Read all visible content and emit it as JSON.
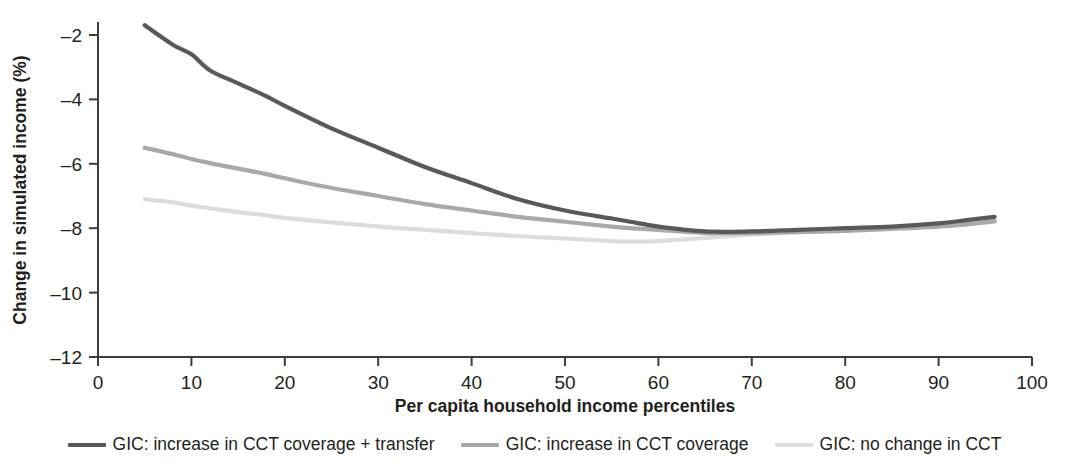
{
  "chart_data": {
    "type": "line",
    "title": "",
    "subtitle": "",
    "xlabel": "Per capita household income percentiles",
    "ylabel": "Change in simulated income (%)",
    "xlim": [
      0,
      100
    ],
    "ylim": [
      -12,
      -1
    ],
    "xticks": [
      0,
      10,
      20,
      30,
      40,
      50,
      60,
      70,
      80,
      90,
      100
    ],
    "xtick_labels": [
      "0",
      "10",
      "20",
      "30",
      "40",
      "50",
      "60",
      "70",
      "80",
      "90",
      "100"
    ],
    "yticks": [
      -2,
      -4,
      -6,
      -8,
      -10,
      -12
    ],
    "ytick_labels": [
      "–2",
      "–4",
      "–6",
      "–8",
      "–10",
      "–12"
    ],
    "grid": false,
    "legend_position": "bottom",
    "x": [
      5,
      8,
      10,
      12,
      15,
      18,
      20,
      25,
      30,
      35,
      40,
      45,
      50,
      55,
      57,
      60,
      65,
      70,
      75,
      80,
      85,
      90,
      93,
      96
    ],
    "series": [
      {
        "name": "GIC: increase in CCT coverage + transfer",
        "color": "#58595b",
        "width": 4.2,
        "values": [
          -1.7,
          -2.3,
          -2.6,
          -3.1,
          -3.5,
          -3.9,
          -4.2,
          -4.9,
          -5.5,
          -6.1,
          -6.6,
          -7.1,
          -7.45,
          -7.7,
          -7.8,
          -7.95,
          -8.1,
          -8.1,
          -8.05,
          -8.0,
          -7.95,
          -7.85,
          -7.75,
          -7.65
        ]
      },
      {
        "name": "GIC: increase in CCT coverage",
        "color": "#a7a9ac",
        "width": 4.2,
        "values": [
          -5.5,
          -5.7,
          -5.85,
          -5.98,
          -6.15,
          -6.32,
          -6.45,
          -6.75,
          -7.0,
          -7.25,
          -7.45,
          -7.65,
          -7.8,
          -7.95,
          -8.0,
          -8.05,
          -8.15,
          -8.15,
          -8.12,
          -8.08,
          -8.02,
          -7.95,
          -7.88,
          -7.78
        ]
      },
      {
        "name": "GIC: no change in CCT",
        "color": "#dcdddf",
        "width": 4.2,
        "values": [
          -7.1,
          -7.2,
          -7.3,
          -7.38,
          -7.5,
          -7.6,
          -7.68,
          -7.82,
          -7.95,
          -8.05,
          -8.15,
          -8.25,
          -8.32,
          -8.4,
          -8.42,
          -8.4,
          -8.3,
          -8.2,
          -8.12,
          -8.06,
          -8.0,
          -7.93,
          -7.88,
          -7.8
        ]
      }
    ]
  },
  "legend": {
    "items": [
      {
        "label": "GIC: increase in CCT coverage + transfer",
        "color": "#58595b"
      },
      {
        "label": "GIC: increase in CCT coverage",
        "color": "#a7a9ac"
      },
      {
        "label": "GIC: no change in CCT",
        "color": "#dcdddf"
      }
    ]
  }
}
